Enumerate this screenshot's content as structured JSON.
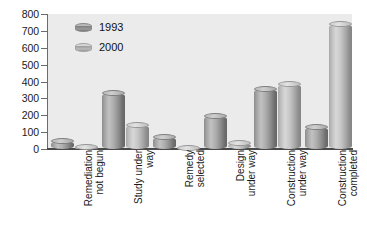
{
  "chart_data": {
    "type": "bar",
    "title": "",
    "xlabel": "",
    "ylabel": "",
    "ylim": [
      0,
      800
    ],
    "ytick_step": 100,
    "grid": false,
    "legend_position": "top-left",
    "categories": [
      "Remediation\nnot begun",
      "Study under\nway",
      "Remedy\nselected",
      "Design\nunder way",
      "Construction\nunder way",
      "Construction\ncompleted"
    ],
    "ytick_labels": [
      "800",
      "700",
      "600",
      "500",
      "400",
      "300",
      "200",
      "100",
      "0"
    ],
    "series": [
      {
        "name": "1993",
        "color": "#9a9a9a",
        "values": [
          68,
          350,
          90,
          212,
          375,
          150
        ]
      },
      {
        "name": "2000",
        "color": "#c2c2c2",
        "values": [
          32,
          160,
          25,
          55,
          405,
          760
        ]
      }
    ]
  },
  "legend": {
    "items": [
      {
        "label": "1993"
      },
      {
        "label": "2000"
      }
    ]
  },
  "axes": {
    "y_ticks": [
      {
        "label": "800",
        "value": 800
      },
      {
        "label": "700",
        "value": 700
      },
      {
        "label": "600",
        "value": 600
      },
      {
        "label": "500",
        "value": 500
      },
      {
        "label": "400",
        "value": 400
      },
      {
        "label": "300",
        "value": 300
      },
      {
        "label": "200",
        "value": 200
      },
      {
        "label": "100",
        "value": 100
      },
      {
        "label": "0",
        "value": 0
      }
    ],
    "x_labels": [
      {
        "line1": "Remediation",
        "line2": "not begun"
      },
      {
        "line1": "Study under",
        "line2": "way"
      },
      {
        "line1": "Remedy",
        "line2": "selected"
      },
      {
        "line1": "Design",
        "line2": "under way"
      },
      {
        "line1": "Construction",
        "line2": "under way"
      },
      {
        "line1": "Construction",
        "line2": "completed"
      }
    ]
  }
}
